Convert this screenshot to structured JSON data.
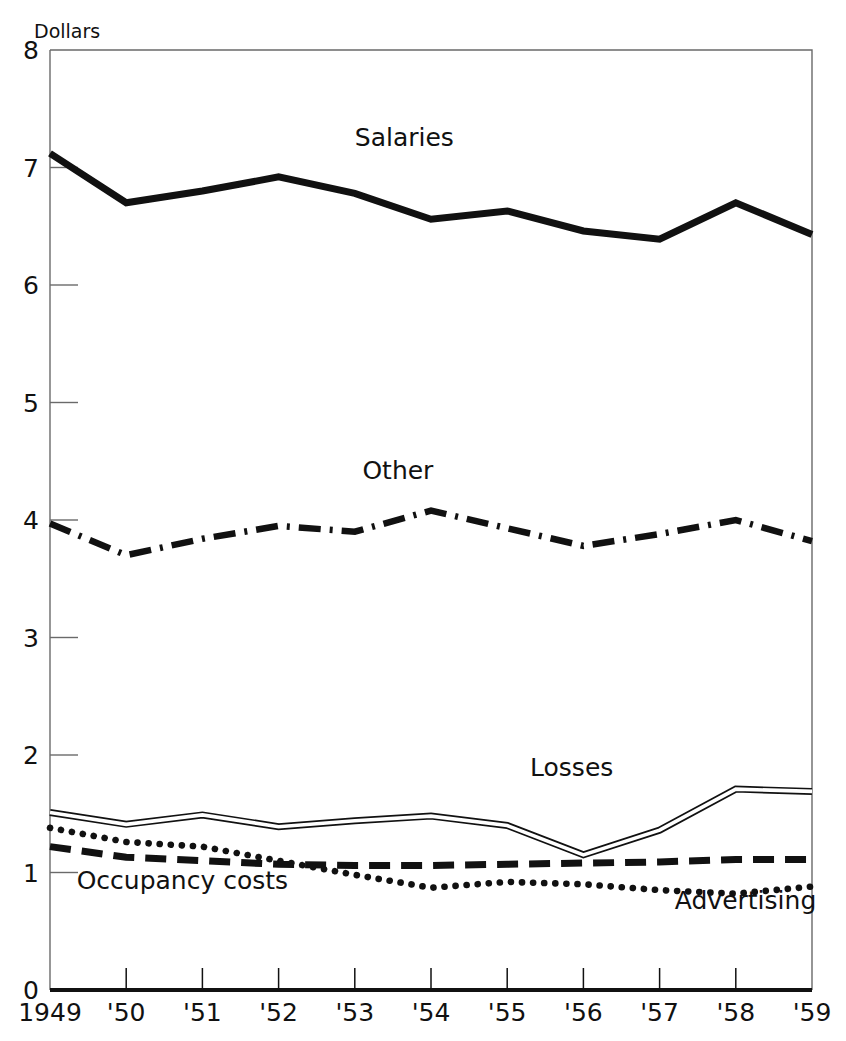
{
  "chart_data": {
    "type": "line",
    "title": "",
    "subtitle": "",
    "xlabel": "",
    "ylabel": "Dollars",
    "x": [
      1949,
      1950,
      1951,
      1952,
      1953,
      1954,
      1955,
      1956,
      1957,
      1958,
      1959
    ],
    "xtick_labels": [
      "1949",
      "'50",
      "'51",
      "'52",
      "'53",
      "'54",
      "'55",
      "'56",
      "'57",
      "'58",
      "'59"
    ],
    "ytick_labels": [
      "0",
      "1",
      "2",
      "3",
      "4",
      "5",
      "6",
      "7",
      "8"
    ],
    "ytick_values": [
      0,
      1,
      2,
      3,
      4,
      5,
      6,
      7,
      8
    ],
    "xlim": [
      1949,
      1959
    ],
    "ylim": [
      0,
      8
    ],
    "grid": false,
    "legend_position": "inline-labels",
    "series": [
      {
        "name": "Salaries",
        "style": "solid-thick",
        "label_x": 1953.0,
        "label_y": 7.18,
        "values": [
          7.12,
          6.7,
          6.8,
          6.92,
          6.78,
          6.56,
          6.63,
          6.46,
          6.39,
          6.7,
          6.43
        ]
      },
      {
        "name": "Other",
        "style": "dash-dot",
        "label_x": 1953.1,
        "label_y": 4.35,
        "values": [
          3.97,
          3.7,
          3.84,
          3.95,
          3.9,
          4.08,
          3.93,
          3.78,
          3.88,
          4.0,
          3.82
        ]
      },
      {
        "name": "Losses",
        "style": "double-line",
        "label_x": 1955.3,
        "label_y": 1.82,
        "values": [
          1.51,
          1.41,
          1.49,
          1.39,
          1.44,
          1.48,
          1.4,
          1.15,
          1.36,
          1.71,
          1.69
        ]
      },
      {
        "name": "Occupancy costs",
        "style": "dashed",
        "label_x": 1949.35,
        "label_y": 0.86,
        "values": [
          1.22,
          1.13,
          1.1,
          1.07,
          1.06,
          1.06,
          1.07,
          1.08,
          1.09,
          1.11,
          1.11
        ]
      },
      {
        "name": "Advertising",
        "style": "dotted",
        "label_x": 1957.2,
        "label_y": 0.69,
        "values": [
          1.38,
          1.26,
          1.22,
          1.1,
          0.98,
          0.87,
          0.92,
          0.9,
          0.85,
          0.82,
          0.88
        ]
      }
    ]
  }
}
